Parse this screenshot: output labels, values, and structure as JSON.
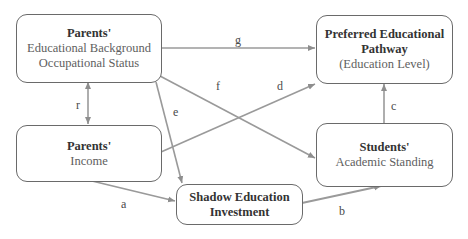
{
  "colors": {
    "box_border": "#6a6a6a",
    "arrow": "#9a9a9a",
    "title_text": "#333333",
    "body_text": "#5e5e5e"
  },
  "nodes": {
    "parents_background": {
      "title": "Parents'",
      "lines": [
        "Educational Background",
        "Occupational Status"
      ]
    },
    "parents_income": {
      "title": "Parents'",
      "lines": [
        "Income"
      ]
    },
    "shadow_education": {
      "title_lines": [
        "Shadow Education",
        "Investment"
      ]
    },
    "preferred_pathway": {
      "title_lines": [
        "Preferred Educational",
        "Pathway"
      ],
      "lines": [
        "(Education Level)"
      ]
    },
    "students_standing": {
      "title": "Students'",
      "lines": [
        "Academic Standing"
      ]
    }
  },
  "edges": [
    {
      "label": "r",
      "from": "parents_background",
      "to": "parents_income",
      "bidirectional": true
    },
    {
      "label": "g",
      "from": "parents_background",
      "to": "preferred_pathway"
    },
    {
      "label": "f",
      "from": "parents_background",
      "to": "students_standing"
    },
    {
      "label": "e",
      "from": "parents_background",
      "to": "shadow_education"
    },
    {
      "label": "d",
      "from": "parents_income",
      "to": "preferred_pathway"
    },
    {
      "label": "a",
      "from": "parents_income",
      "to": "shadow_education"
    },
    {
      "label": "b",
      "from": "shadow_education",
      "to": "students_standing"
    },
    {
      "label": "c",
      "from": "students_standing",
      "to": "preferred_pathway"
    }
  ]
}
